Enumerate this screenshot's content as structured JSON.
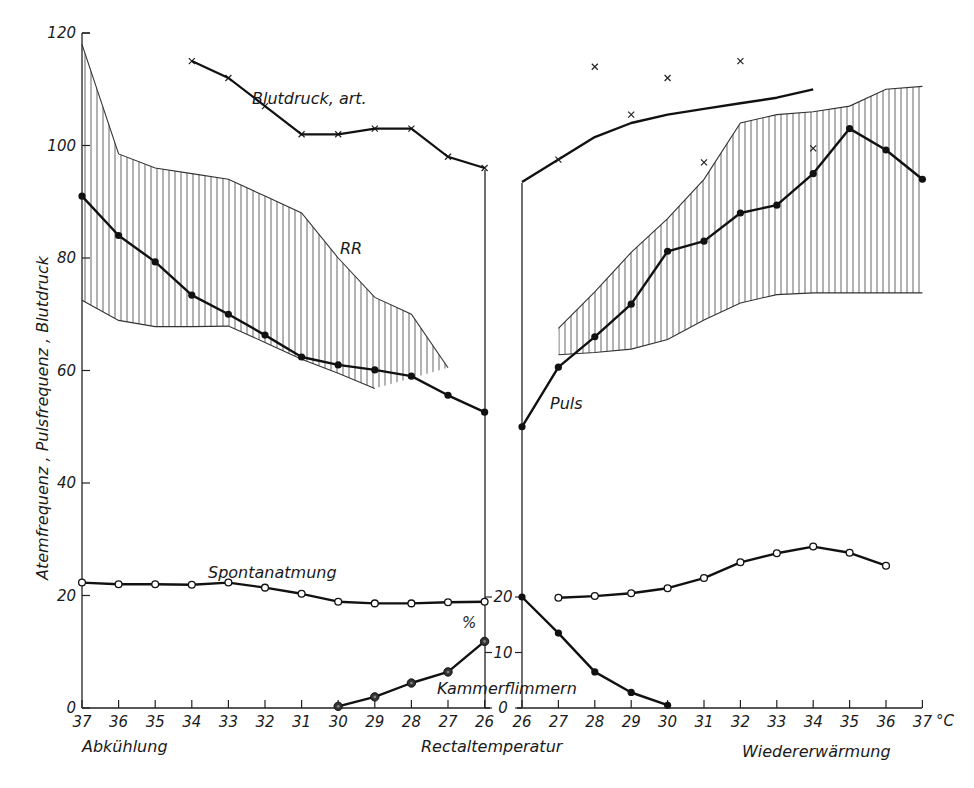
{
  "chart_data": {
    "type": "line",
    "title": "",
    "ylabel": "Atemfrequenz , Pulsfrequenz , Blutdruck",
    "ylabel_secondary": "%",
    "xlabel": "Rectaltemperatur",
    "x_unit": "°C",
    "ylim": [
      0,
      120
    ],
    "yticks": [
      0,
      20,
      40,
      60,
      80,
      100,
      120
    ],
    "ylim_secondary": [
      0,
      20
    ],
    "yticks_secondary": [
      0,
      10,
      20
    ],
    "grid": false,
    "legend": "inline labels",
    "panels": [
      {
        "name": "Abkühlung",
        "x_direction": "descending",
        "x": [
          37,
          36,
          35,
          34,
          33,
          32,
          31,
          30,
          29,
          28,
          27,
          26
        ],
        "series": [
          {
            "name": "Puls",
            "marker": "filled-dot",
            "values": [
              91,
              84,
              79.3,
              73.4,
              70,
              66.3,
              62.4,
              61,
              60.1,
              59,
              55.6,
              52.6
            ]
          },
          {
            "name": "RR band upper",
            "style": "hatched-band-upper",
            "values": [
              118,
              98.5,
              96,
              95,
              94,
              91,
              88,
              80,
              73,
              70,
              60.5,
              null
            ]
          },
          {
            "name": "RR band lower",
            "style": "hatched-band-lower",
            "values": [
              72.5,
              68.9,
              67.8,
              67.8,
              67.9,
              65,
              62,
              59.5,
              56.8,
              null,
              null,
              null
            ]
          },
          {
            "name": "Blutdruck, art.",
            "marker": "cross",
            "values": [
              null,
              null,
              null,
              115,
              112,
              107,
              102,
              102,
              103,
              103,
              98,
              96
            ]
          },
          {
            "name": "Spontanatmung",
            "marker": "open-circle",
            "values": [
              22.3,
              22,
              22,
              21.9,
              22.3,
              21.4,
              20.3,
              18.9,
              18.6,
              18.6,
              18.8,
              18.9
            ]
          },
          {
            "name": "Kammerflimmern (%)",
            "axis": "secondary",
            "marker": "ringed-dot",
            "values": [
              null,
              null,
              null,
              null,
              null,
              null,
              null,
              0.3,
              2,
              4.5,
              6.5,
              12
            ]
          }
        ]
      },
      {
        "name": "Wiedererwärmung",
        "x_direction": "ascending",
        "x": [
          26,
          27,
          28,
          29,
          30,
          31,
          32,
          33,
          34,
          35,
          36,
          37
        ],
        "series": [
          {
            "name": "Puls",
            "marker": "filled-dot",
            "values": [
              50,
              60.6,
              66,
              71.8,
              81.2,
              83,
              88,
              89.4,
              95,
              103,
              99.2,
              94
            ]
          },
          {
            "name": "RR band upper",
            "style": "hatched-band-upper",
            "values": [
              null,
              67.5,
              74,
              81,
              87,
              94,
              104,
              105.5,
              106,
              107,
              110,
              110.5
            ]
          },
          {
            "name": "RR band lower",
            "style": "hatched-band-lower",
            "values": [
              null,
              62.8,
              63.2,
              63.8,
              65.5,
              69,
              72,
              73.5,
              73.8,
              73.8,
              73.8,
              73.8
            ]
          },
          {
            "name": "Blutdruck, art. (curve)",
            "style": "line",
            "values": [
              93.5,
              97.5,
              101.5,
              104,
              105.5,
              106.5,
              107.5,
              108.5,
              110,
              null,
              null,
              null
            ]
          },
          {
            "name": "Blutdruck, art. (measured)",
            "marker": "cross",
            "values": [
              null,
              97.5,
              114,
              105.5,
              112,
              97,
              115,
              null,
              99.5,
              null,
              null,
              null
            ]
          },
          {
            "name": "Spontanatmung",
            "marker": "open-circle",
            "values": [
              null,
              19.6,
              19.9,
              20.4,
              21.3,
              23.1,
              25.9,
              27.5,
              28.7,
              27.6,
              25.3,
              null
            ]
          },
          {
            "name": "Kammerflimmern (%)",
            "axis": "secondary",
            "marker": "filled-dot",
            "values": [
              20,
              13.5,
              6.5,
              2.8,
              0.5,
              null,
              null,
              null,
              null,
              null,
              null,
              null
            ]
          }
        ]
      }
    ],
    "annotations": [
      "Blutdruck, art.",
      "RR",
      "Puls",
      "Spontanatmung",
      "Kammerflimmern",
      "Abkühlung",
      "Rectaltemperatur",
      "Wiedererwärmung"
    ]
  },
  "labels": {
    "ylabel": "Atemfrequenz , Pulsfrequenz , Blutdruck",
    "percent_symbol": "%",
    "blutdruck": "Blutdruck, art.",
    "rr": "RR",
    "puls": "Puls",
    "spontanatmung": "Spontanatmung",
    "kammerflimmern": "Kammerflimmern",
    "abkuehlung": "Abkühlung",
    "rectaltemperatur": "Rectaltemperatur",
    "wiedererwaermung": "Wiedererwärmung",
    "unit": "°C"
  },
  "axis": {
    "left_ticks": [
      "0",
      "20",
      "40",
      "60",
      "80",
      "100",
      "120"
    ],
    "pct_ticks": [
      "0",
      "10",
      "20"
    ],
    "x_left_ticks": [
      "37",
      "36",
      "35",
      "34",
      "33",
      "32",
      "31",
      "30",
      "29",
      "28",
      "27",
      "26"
    ],
    "x_right_ticks": [
      "26",
      "27",
      "28",
      "29",
      "30",
      "31",
      "32",
      "33",
      "34",
      "35",
      "36",
      "37"
    ]
  }
}
